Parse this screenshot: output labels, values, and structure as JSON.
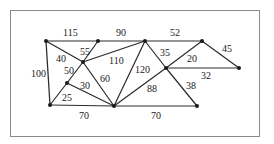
{
  "graph": {
    "nodes": [
      {
        "id": "A",
        "x": 46,
        "y": 41
      },
      {
        "id": "B",
        "x": 98,
        "y": 41
      },
      {
        "id": "C",
        "x": 145,
        "y": 41
      },
      {
        "id": "D",
        "x": 202,
        "y": 41
      },
      {
        "id": "E",
        "x": 239,
        "y": 68
      },
      {
        "id": "F",
        "x": 83,
        "y": 62
      },
      {
        "id": "G",
        "x": 67,
        "y": 83
      },
      {
        "id": "H",
        "x": 50,
        "y": 105
      },
      {
        "id": "I",
        "x": 114,
        "y": 106
      },
      {
        "id": "J",
        "x": 166,
        "y": 68
      },
      {
        "id": "K",
        "x": 197,
        "y": 106
      }
    ],
    "edges": [
      {
        "from": "A",
        "to": "B",
        "weight": "115",
        "lx": 63,
        "ly": 36
      },
      {
        "from": "B",
        "to": "C",
        "weight": "90",
        "lx": 116,
        "ly": 36
      },
      {
        "from": "C",
        "to": "D",
        "weight": "52",
        "lx": 170,
        "ly": 36
      },
      {
        "from": "D",
        "to": "E",
        "weight": "45",
        "lx": 222,
        "ly": 52
      },
      {
        "from": "A",
        "to": "H",
        "weight": "100",
        "lx": 31,
        "ly": 77
      },
      {
        "from": "A",
        "to": "F",
        "weight": "40",
        "lx": 56,
        "ly": 62
      },
      {
        "from": "B",
        "to": "F",
        "weight": "55",
        "lx": 80,
        "ly": 55
      },
      {
        "from": "F",
        "to": "C",
        "weight": "110",
        "lx": 109,
        "ly": 64
      },
      {
        "from": "F",
        "to": "G",
        "weight": "50",
        "lx": 64,
        "ly": 74
      },
      {
        "from": "F",
        "to": "I",
        "weight": "60",
        "lx": 100,
        "ly": 82
      },
      {
        "from": "G",
        "to": "H",
        "weight": "25",
        "lx": 62,
        "ly": 101
      },
      {
        "from": "G",
        "to": "I",
        "weight": "30",
        "lx": 80,
        "ly": 89
      },
      {
        "from": "H",
        "to": "I",
        "weight": "70",
        "lx": 79,
        "ly": 119
      },
      {
        "from": "C",
        "to": "I",
        "weight": "120",
        "lx": 135,
        "ly": 73
      },
      {
        "from": "C",
        "to": "J",
        "weight": "35",
        "lx": 160,
        "ly": 56
      },
      {
        "from": "D",
        "to": "J",
        "weight": "20",
        "lx": 187,
        "ly": 62
      },
      {
        "from": "J",
        "to": "E",
        "weight": "32",
        "lx": 201,
        "ly": 79
      },
      {
        "from": "I",
        "to": "J",
        "weight": "88",
        "lx": 147,
        "ly": 92
      },
      {
        "from": "J",
        "to": "K",
        "weight": "38",
        "lx": 186,
        "ly": 89
      },
      {
        "from": "I",
        "to": "K",
        "weight": "70",
        "lx": 151,
        "ly": 119
      }
    ]
  }
}
